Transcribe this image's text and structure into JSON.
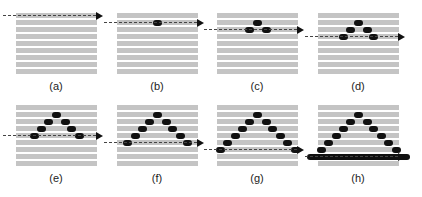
{
  "figure": {
    "stripe_color": "#c4c4c4",
    "blob_color": "#111111",
    "scan_line_color": "#444444",
    "stripe_count": 9,
    "panels": [
      {
        "label": "(a)",
        "scan_row": 0,
        "left": 0,
        "top": 0,
        "solid_bar": false
      },
      {
        "label": "(b)",
        "scan_row": 1,
        "left": 101,
        "top": 0,
        "solid_bar": false
      },
      {
        "label": "(c)",
        "scan_row": 2,
        "left": 201,
        "top": 0,
        "solid_bar": false
      },
      {
        "label": "(d)",
        "scan_row": 3,
        "left": 302,
        "top": 0,
        "solid_bar": false
      },
      {
        "label": "(e)",
        "scan_row": 4,
        "left": 0,
        "top": 92,
        "solid_bar": false
      },
      {
        "label": "(f)",
        "scan_row": 5,
        "left": 101,
        "top": 92,
        "solid_bar": false
      },
      {
        "label": "(g)",
        "scan_row": 6,
        "left": 201,
        "top": 92,
        "solid_bar": false
      },
      {
        "label": "(h)",
        "scan_row": 7,
        "left": 302,
        "top": 92,
        "solid_bar": true
      }
    ]
  }
}
